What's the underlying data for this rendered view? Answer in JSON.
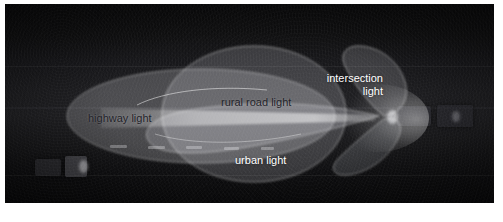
{
  "figure": {
    "kind": "night-road-photograph-with-beam-pattern-overlay"
  },
  "scene": {
    "background_color": "#0b0b0c",
    "road_surface_color": "#202023",
    "vehicles": [
      {
        "name": "oncoming-vehicle-left-near",
        "x": 30,
        "y": 155,
        "w": 26,
        "h": 17
      },
      {
        "name": "oncoming-vehicle-left-far",
        "x": 60,
        "y": 152,
        "w": 22,
        "h": 21
      },
      {
        "name": "preceding-vehicle-right-near",
        "x": 392,
        "y": 102,
        "w": 34,
        "h": 20
      },
      {
        "name": "preceding-vehicle-right-far",
        "x": 432,
        "y": 101,
        "w": 36,
        "h": 22
      }
    ],
    "lane_dashes": [
      {
        "x": 105,
        "y": 141,
        "w": 17
      },
      {
        "x": 143,
        "y": 142,
        "w": 17
      },
      {
        "x": 181,
        "y": 142,
        "w": 16
      },
      {
        "x": 219,
        "y": 143,
        "w": 15
      },
      {
        "x": 256,
        "y": 143,
        "w": 13
      }
    ]
  },
  "beams": [
    {
      "id": "highway",
      "label": "highway light",
      "fill": "rgba(236,238,242,0.30)",
      "stroke": "rgba(255,255,255,0.55)",
      "label_color": "#23232a",
      "label_x": 83,
      "label_y": 108
    },
    {
      "id": "rural_road",
      "label": "rural road light",
      "fill": "rgba(238,240,244,0.26)",
      "stroke": "rgba(255,255,255,0.6)",
      "label_color": "#23232a",
      "label_x": 216,
      "label_y": 92
    },
    {
      "id": "intersection",
      "label": "intersection\nlight",
      "fill": "rgba(232,234,240,0.22)",
      "stroke": "rgba(255,255,255,0.6)",
      "label_color": "#ffffff",
      "label_x": 306,
      "label_y": 68
    },
    {
      "id": "urban",
      "label": "urban light",
      "fill": "rgba(230,232,238,0.24)",
      "stroke": "rgba(255,255,255,0.55)",
      "label_color": "#ffffff",
      "label_x": 230,
      "label_y": 150
    }
  ],
  "beam_core": {
    "name": "bright-beam-core",
    "color": "rgba(250,250,252,0.55)"
  },
  "convergence_point": {
    "x": 379,
    "y": 115
  }
}
